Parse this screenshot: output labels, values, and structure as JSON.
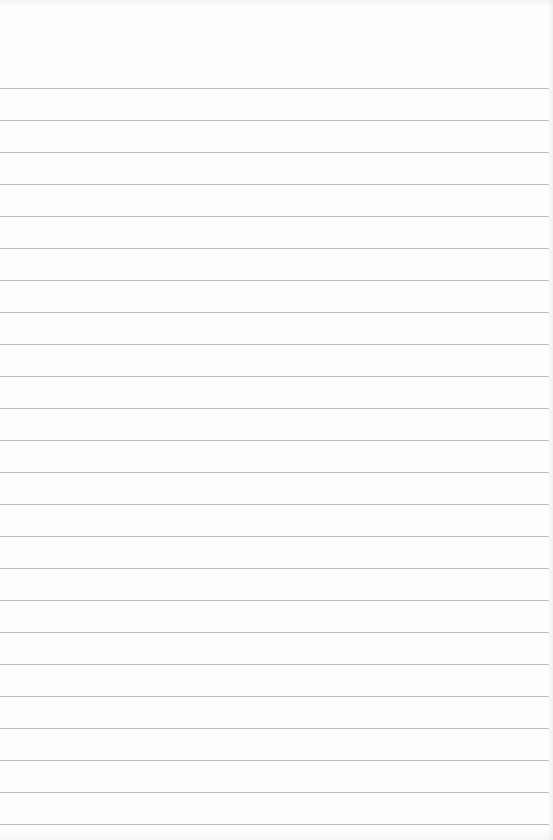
{
  "document": {
    "type": "lined-paper",
    "background_color": "#fefefe",
    "line_color": "#bdbdbd",
    "line_count": 24,
    "first_line_y": 88,
    "line_spacing": 32,
    "line_width": 549,
    "text": ""
  }
}
